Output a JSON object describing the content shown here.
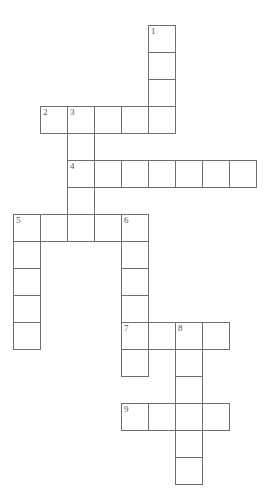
{
  "puzzle": {
    "type": "crossword-grid",
    "title": "",
    "grid": {
      "cell_size": 27,
      "origin_x": 13,
      "origin_y": 25,
      "columns": 9,
      "rows": 17,
      "line_color": "#6f6f6f",
      "cell_fill": "#ffffff",
      "background": "#ffffff",
      "number_color": "#555555"
    },
    "entries": [
      {
        "number": "1",
        "direction": "down",
        "start_col": 5,
        "start_row": 0,
        "length": 4
      },
      {
        "number": "2",
        "direction": "across",
        "start_col": 1,
        "start_row": 3,
        "length": 5
      },
      {
        "number": "3",
        "direction": "down",
        "start_col": 2,
        "start_row": 3,
        "length": 5
      },
      {
        "number": "4",
        "direction": "across",
        "start_col": 2,
        "start_row": 5,
        "length": 7
      },
      {
        "number": "5",
        "direction": "across",
        "start_col": 0,
        "start_row": 7,
        "length": 5
      },
      {
        "number": "5",
        "direction": "down",
        "start_col": 0,
        "start_row": 7,
        "length": 5
      },
      {
        "number": "6",
        "direction": "down",
        "start_col": 4,
        "start_row": 7,
        "length": 5
      },
      {
        "number": "7",
        "direction": "across",
        "start_col": 4,
        "start_row": 11,
        "length": 4
      },
      {
        "number": "7",
        "direction": "down",
        "start_col": 4,
        "start_row": 11,
        "length": 2
      },
      {
        "number": "8",
        "direction": "down",
        "start_col": 6,
        "start_row": 11,
        "length": 6
      },
      {
        "number": "9",
        "direction": "across",
        "start_col": 4,
        "start_row": 14,
        "length": 4
      }
    ],
    "cells": [
      {
        "col": 5,
        "row": 0,
        "number": "1"
      },
      {
        "col": 5,
        "row": 1,
        "number": ""
      },
      {
        "col": 5,
        "row": 2,
        "number": ""
      },
      {
        "col": 1,
        "row": 3,
        "number": "2"
      },
      {
        "col": 2,
        "row": 3,
        "number": "3"
      },
      {
        "col": 3,
        "row": 3,
        "number": ""
      },
      {
        "col": 4,
        "row": 3,
        "number": ""
      },
      {
        "col": 5,
        "row": 3,
        "number": ""
      },
      {
        "col": 2,
        "row": 4,
        "number": ""
      },
      {
        "col": 2,
        "row": 5,
        "number": "4"
      },
      {
        "col": 3,
        "row": 5,
        "number": ""
      },
      {
        "col": 4,
        "row": 5,
        "number": ""
      },
      {
        "col": 5,
        "row": 5,
        "number": ""
      },
      {
        "col": 6,
        "row": 5,
        "number": ""
      },
      {
        "col": 7,
        "row": 5,
        "number": ""
      },
      {
        "col": 8,
        "row": 5,
        "number": ""
      },
      {
        "col": 2,
        "row": 6,
        "number": ""
      },
      {
        "col": 0,
        "row": 7,
        "number": "5"
      },
      {
        "col": 1,
        "row": 7,
        "number": ""
      },
      {
        "col": 2,
        "row": 7,
        "number": ""
      },
      {
        "col": 3,
        "row": 7,
        "number": ""
      },
      {
        "col": 4,
        "row": 7,
        "number": "6"
      },
      {
        "col": 0,
        "row": 8,
        "number": ""
      },
      {
        "col": 4,
        "row": 8,
        "number": ""
      },
      {
        "col": 0,
        "row": 9,
        "number": ""
      },
      {
        "col": 4,
        "row": 9,
        "number": ""
      },
      {
        "col": 0,
        "row": 10,
        "number": ""
      },
      {
        "col": 4,
        "row": 10,
        "number": ""
      },
      {
        "col": 0,
        "row": 11,
        "number": ""
      },
      {
        "col": 4,
        "row": 11,
        "number": "7"
      },
      {
        "col": 5,
        "row": 11,
        "number": ""
      },
      {
        "col": 6,
        "row": 11,
        "number": "8"
      },
      {
        "col": 7,
        "row": 11,
        "number": ""
      },
      {
        "col": 4,
        "row": 12,
        "number": ""
      },
      {
        "col": 6,
        "row": 12,
        "number": ""
      },
      {
        "col": 6,
        "row": 13,
        "number": ""
      },
      {
        "col": 4,
        "row": 14,
        "number": "9"
      },
      {
        "col": 5,
        "row": 14,
        "number": ""
      },
      {
        "col": 6,
        "row": 14,
        "number": ""
      },
      {
        "col": 7,
        "row": 14,
        "number": ""
      },
      {
        "col": 6,
        "row": 15,
        "number": ""
      },
      {
        "col": 6,
        "row": 16,
        "number": ""
      }
    ]
  }
}
